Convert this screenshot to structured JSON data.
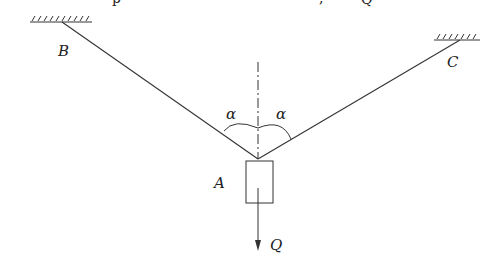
{
  "diagram": {
    "type": "statics-free-body",
    "labels": {
      "B": "B",
      "C": "C",
      "A": "A",
      "Q": "Q",
      "alpha_left": "α",
      "alpha_right": "α"
    },
    "top_fragments": {
      "f1": "p",
      "f2": ",",
      "f3": "Q"
    },
    "colors": {
      "stroke": "#333333",
      "background": "#ffffff"
    },
    "geometry": {
      "anchor_B": [
        62,
        22
      ],
      "anchor_C": [
        460,
        40
      ],
      "point_A": [
        258,
        159
      ],
      "box": {
        "x": 246,
        "y": 161,
        "w": 27,
        "h": 42
      },
      "arrow_tip": [
        258,
        250
      ]
    }
  }
}
